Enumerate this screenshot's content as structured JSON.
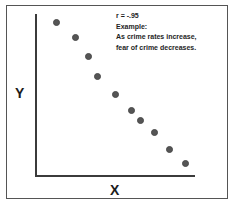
{
  "figure": {
    "frame_color": "#555555",
    "axis_color": "#3b3b3b",
    "point_color": "#555555",
    "background": "#ffffff"
  },
  "annotation": {
    "lines": [
      "r = -.95",
      "Example:",
      "As crime rates increase,",
      "fear of crime decreases."
    ],
    "line_1": "r = -.95",
    "line_2": "Example:",
    "line_3": "As crime rates increase,",
    "line_4": "fear of crime decreases."
  },
  "axes": {
    "y_label": "Y",
    "x_label": "X"
  },
  "chart_data": {
    "type": "scatter",
    "title": "",
    "xlabel": "X",
    "ylabel": "Y",
    "correlation": "-.95",
    "annotation": "r = -.95 Example: As crime rates increase, fear of crime decreases.",
    "xlim": [
      0,
      100
    ],
    "ylim": [
      0,
      100
    ],
    "grid": false,
    "legend": "none",
    "axis_ticks": false,
    "series": [
      {
        "name": "observations",
        "color": "#555555",
        "points": [
          {
            "x": 14,
            "y": 95,
            "px": 57,
            "py": 23
          },
          {
            "x": 26,
            "y": 86,
            "px": 76,
            "py": 38
          },
          {
            "x": 33,
            "y": 74,
            "px": 89,
            "py": 57
          },
          {
            "x": 40,
            "y": 62,
            "px": 98,
            "py": 77
          },
          {
            "x": 52,
            "y": 53,
            "px": 116,
            "py": 95
          },
          {
            "x": 64,
            "y": 43,
            "px": 132,
            "py": 111
          },
          {
            "x": 70,
            "y": 37,
            "px": 141,
            "py": 121
          },
          {
            "x": 78,
            "y": 30,
            "px": 155,
            "py": 133
          },
          {
            "x": 88,
            "y": 21,
            "px": 170,
            "py": 150
          },
          {
            "x": 98,
            "y": 13,
            "px": 186,
            "py": 164
          }
        ]
      }
    ]
  }
}
